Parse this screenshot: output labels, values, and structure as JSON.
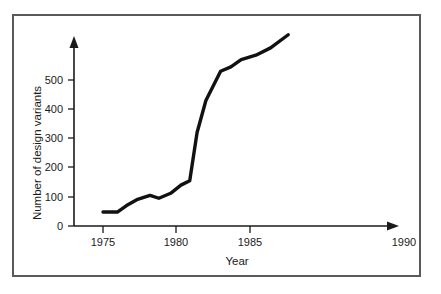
{
  "chart_data": {
    "type": "line",
    "title": "",
    "xlabel": "Year",
    "ylabel": "Number of design variants",
    "xlim": [
      1973.5,
      1991
    ],
    "ylim": [
      0,
      700
    ],
    "grid": false,
    "legend": null,
    "xticks": [
      1975,
      1980,
      1985,
      1990
    ],
    "xticklabels": [
      "1975",
      "1980",
      "1985",
      "1990"
    ],
    "yticks": [
      0,
      100,
      200,
      300,
      400,
      500
    ],
    "yticklabels": [
      "0",
      "100",
      "200",
      "300",
      "400",
      "500"
    ],
    "series": [
      {
        "name": "Number of design variants",
        "color": "#111111",
        "x": [
          1975.0,
          1976.0,
          1976.6,
          1977.3,
          1978.2,
          1978.8,
          1979.6,
          1980.3,
          1980.9,
          1981.4,
          1982.0,
          1983.0,
          1983.7,
          1984.4,
          1985.4,
          1986.4,
          1987.6
        ],
        "values": [
          48,
          48,
          70,
          90,
          105,
          95,
          112,
          140,
          155,
          320,
          430,
          530,
          545,
          570,
          585,
          610,
          655
        ]
      }
    ],
    "annotations": []
  },
  "axis_titles": {
    "x": "Year",
    "y": "Number of design variants"
  }
}
